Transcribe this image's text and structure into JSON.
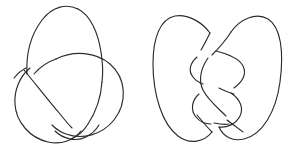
{
  "figure": {
    "background_color": "#ffffff",
    "stroke_color": "#2b2b2b",
    "stroke_width": 1.15,
    "width": 289,
    "height": 149,
    "diagram_count": 2,
    "has_border": false,
    "has_caption": false,
    "has_labels": false
  },
  "diagrams": [
    {
      "name": "trefoil-knot",
      "label": "",
      "crossing_number": 3,
      "position": "left",
      "bounds": {
        "x": 12,
        "y": 6,
        "width": 118,
        "height": 138
      },
      "description": "Trefoil knot projection with three crossings: one upper crossing, one left crossing, one lower crossing",
      "strands": [
        {
          "name": "top-loop-outer",
          "path": "M 100 78 C 102 40 92 12 72 7 C 52 2 38 28 36 58 C 35 80 40 100 48 114"
        },
        {
          "name": "right-lobe",
          "path": "M 58 66 C 78 56 103 58 114 72 C 128 90 122 118 102 130 C 84 141 62 135 54 120"
        },
        {
          "name": "left-lobe",
          "path": "M 40 62 C 26 66 15 80 15 98 C 15 120 30 138 52 141 C 70 143 84 133 90 120"
        },
        {
          "name": "inner-connector-left",
          "path": "M 33 64 C 47 78 64 100 78 116"
        },
        {
          "name": "inner-connector-right",
          "path": "M 92 66 C 86 86 76 110 64 126"
        }
      ]
    },
    {
      "name": "figure-eight-knot",
      "label": "",
      "crossing_number": 4,
      "position": "right",
      "bounds": {
        "x": 152,
        "y": 10,
        "width": 128,
        "height": 132
      },
      "description": "Figure-eight knot projection with four crossings: two large outer lobes and a central twisted region",
      "strands": [
        {
          "name": "left-outer-lobe",
          "path": "M 213 36 C 205 22 188 14 173 18 C 157 23 152 44 153 72 C 154 104 166 132 186 139 C 202 144 214 134 219 122"
        },
        {
          "name": "right-outer-lobe",
          "path": "M 228 36 C 238 20 256 14 268 22 C 281 32 282 58 278 88 C 274 118 260 138 243 140 C 230 141 222 133 219 124"
        },
        {
          "name": "central-upper-strand",
          "path": "M 207 40 C 214 50 222 58 228 64"
        },
        {
          "name": "central-s-curve-left",
          "path": "M 221 46 C 206 54 196 62 194 72 C 192 82 200 90 210 96"
        },
        {
          "name": "central-s-curve-right",
          "path": "M 233 70 C 243 78 246 88 240 96 C 234 104 222 108 214 112"
        },
        {
          "name": "central-lower-strand",
          "path": "M 197 102 C 204 110 212 118 220 124"
        },
        {
          "name": "inner-left-arc",
          "path": "M 192 68 C 186 62 186 52 193 46 C 200 40 210 38 216 42"
        },
        {
          "name": "inner-right-arc",
          "path": "M 240 70 C 248 64 250 52 244 44 C 240 38 232 36 226 38"
        },
        {
          "name": "inner-left-lower-arc",
          "path": "M 191 78 C 185 86 186 98 194 104"
        },
        {
          "name": "inner-right-lower-arc",
          "path": "M 243 82 C 250 90 250 102 244 110 C 238 118 228 122 222 120"
        }
      ]
    }
  ]
}
